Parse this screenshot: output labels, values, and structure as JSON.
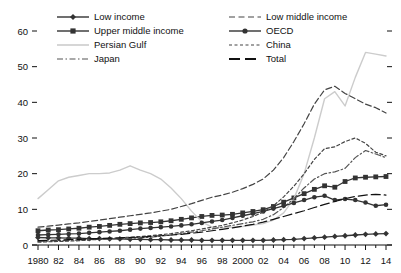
{
  "chart_data": {
    "type": "line",
    "title": "",
    "subtitle": "",
    "xlabel": "",
    "ylabel": "",
    "xlim": [
      1980,
      2014
    ],
    "ylim": [
      0,
      65
    ],
    "yticks": [
      0,
      10,
      20,
      30,
      40,
      50,
      60
    ],
    "ytick_labels": [
      "0",
      "10",
      "20",
      "30",
      "40",
      "50",
      "60"
    ],
    "x": [
      1980,
      1981,
      1982,
      1983,
      1984,
      1985,
      1986,
      1987,
      1988,
      1989,
      1990,
      1991,
      1992,
      1993,
      1994,
      1995,
      1996,
      1997,
      1998,
      1999,
      2000,
      2001,
      2002,
      2003,
      2004,
      2005,
      2006,
      2007,
      2008,
      2009,
      2010,
      2011,
      2012,
      2013,
      2014
    ],
    "xtick_values": [
      1980,
      1982,
      1984,
      1986,
      1988,
      1990,
      1992,
      1994,
      1996,
      1998,
      2000,
      2002,
      2004,
      2006,
      2008,
      2010,
      2012,
      2014
    ],
    "xtick_labels": [
      "1980",
      "82",
      "84",
      "86",
      "88",
      "90",
      "92",
      "94",
      "96",
      "98",
      "2000",
      "02",
      "04",
      "06",
      "08",
      "10",
      "12",
      "14"
    ],
    "minor_xticks": true,
    "grid": false,
    "legend_position": "top",
    "legend_columns": 2,
    "series": [
      {
        "name": "Low income",
        "style": "solid",
        "marker": "diamond",
        "color": "#333333",
        "values": [
          2.1,
          2.0,
          2.0,
          1.9,
          1.9,
          1.8,
          1.8,
          1.7,
          1.7,
          1.6,
          1.6,
          1.5,
          1.5,
          1.4,
          1.4,
          1.4,
          1.3,
          1.3,
          1.3,
          1.3,
          1.3,
          1.3,
          1.3,
          1.4,
          1.5,
          1.6,
          1.8,
          2.0,
          2.2,
          2.4,
          2.6,
          2.8,
          3.0,
          3.1,
          3.2
        ]
      },
      {
        "name": "Upper middle income",
        "style": "solid",
        "marker": "square",
        "color": "#333333",
        "values": [
          4.0,
          4.2,
          4.3,
          4.5,
          4.7,
          5.0,
          5.2,
          5.5,
          5.8,
          6.0,
          6.2,
          6.3,
          6.5,
          6.8,
          7.2,
          7.6,
          8.0,
          8.3,
          8.4,
          8.6,
          9.0,
          9.4,
          9.9,
          10.8,
          12.0,
          13.2,
          14.4,
          15.6,
          16.6,
          16.2,
          17.8,
          18.8,
          19.0,
          19.1,
          19.2
        ]
      },
      {
        "name": "Persian Gulf",
        "style": "solid",
        "marker": "none",
        "color": "#cccccc",
        "values": [
          13.0,
          15.5,
          18.0,
          19.0,
          19.5,
          20.0,
          20.0,
          20.2,
          21.0,
          22.2,
          21.0,
          20.0,
          18.5,
          16.0,
          13.0,
          9.5,
          6.5,
          5.0,
          4.8,
          5.0,
          5.2,
          5.6,
          6.0,
          7.0,
          9.0,
          13.0,
          20.0,
          30.0,
          41.0,
          43.0,
          39.0,
          47.0,
          54.0,
          53.5,
          53.0
        ]
      },
      {
        "name": "Japan",
        "style": "dashdot",
        "marker": "none",
        "color": "#555555",
        "values": [
          1.0,
          1.1,
          1.2,
          1.3,
          1.4,
          1.5,
          1.6,
          1.7,
          1.8,
          1.9,
          2.0,
          2.2,
          2.5,
          2.8,
          3.2,
          3.6,
          4.0,
          4.5,
          5.0,
          5.5,
          6.0,
          6.5,
          7.2,
          8.5,
          10.5,
          13.0,
          16.0,
          18.5,
          20.0,
          20.5,
          21.5,
          24.5,
          26.5,
          25.5,
          24.5
        ]
      },
      {
        "name": "Low middle income",
        "style": "dashed-long",
        "marker": "none",
        "color": "#444444",
        "values": [
          5.0,
          5.3,
          5.6,
          5.9,
          6.2,
          6.6,
          7.0,
          7.4,
          7.8,
          8.2,
          8.6,
          9.0,
          9.5,
          10.0,
          10.8,
          11.6,
          12.5,
          13.4,
          14.0,
          14.8,
          15.8,
          17.0,
          18.5,
          21.0,
          24.5,
          29.0,
          34.0,
          39.5,
          43.5,
          44.5,
          42.5,
          41.0,
          39.5,
          38.5,
          37.0
        ]
      },
      {
        "name": "OECD",
        "style": "solid",
        "marker": "circle",
        "color": "#333333",
        "values": [
          2.8,
          2.9,
          3.0,
          3.1,
          3.2,
          3.4,
          3.6,
          3.8,
          4.0,
          4.3,
          4.6,
          4.8,
          5.0,
          5.2,
          5.5,
          5.8,
          6.2,
          6.6,
          7.0,
          7.6,
          8.2,
          8.8,
          9.4,
          10.2,
          11.0,
          11.8,
          12.6,
          13.4,
          13.8,
          12.6,
          12.9,
          12.6,
          11.9,
          11.0,
          11.3
        ]
      },
      {
        "name": "China",
        "style": "dotted-dash",
        "marker": "none",
        "color": "#444444",
        "values": [
          0.8,
          0.9,
          1.0,
          1.1,
          1.2,
          1.4,
          1.6,
          1.8,
          2.0,
          2.2,
          2.4,
          2.6,
          2.9,
          3.2,
          3.6,
          4.0,
          4.5,
          5.0,
          5.5,
          6.2,
          7.0,
          8.0,
          9.2,
          11.0,
          13.5,
          16.5,
          20.0,
          24.0,
          27.0,
          27.5,
          29.0,
          30.0,
          28.5,
          26.0,
          25.0
        ]
      },
      {
        "name": "Total",
        "style": "dashed-xlong",
        "marker": "none",
        "color": "#111111",
        "values": [
          1.2,
          1.3,
          1.4,
          1.5,
          1.6,
          1.7,
          1.8,
          1.9,
          2.0,
          2.1,
          2.2,
          2.4,
          2.6,
          2.8,
          3.0,
          3.3,
          3.6,
          4.0,
          4.4,
          4.8,
          5.3,
          5.8,
          6.4,
          7.2,
          8.0,
          8.8,
          9.6,
          10.5,
          11.4,
          12.2,
          13.0,
          13.6,
          14.0,
          14.2,
          14.0
        ]
      }
    ]
  },
  "legend": {
    "left_column": [
      {
        "label": "Low income",
        "key": "line-diamond-marker"
      },
      {
        "label": "Upper middle income",
        "key": "line-square-marker"
      },
      {
        "label": "Persian Gulf",
        "key": "line-plain-gray"
      },
      {
        "label": "Japan",
        "key": "line-dashdot"
      }
    ],
    "right_column": [
      {
        "label": "Low middle income",
        "key": "line-dashed-long"
      },
      {
        "label": "OECD",
        "key": "line-circle-marker"
      },
      {
        "label": "China",
        "key": "line-dotted-dash"
      },
      {
        "label": "Total",
        "key": "line-dashed-xlong"
      }
    ]
  },
  "colors": {
    "axis": "#111111",
    "persian_gulf": "#cccccc",
    "default_line": "#333333",
    "background": "#ffffff"
  }
}
